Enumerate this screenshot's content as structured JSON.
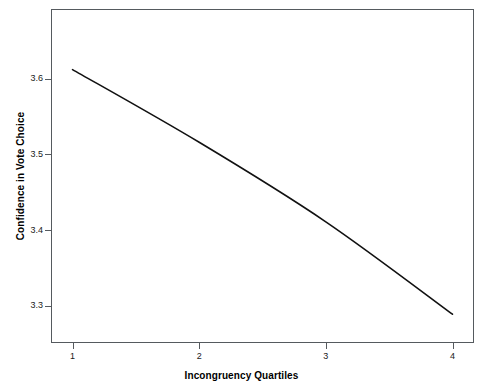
{
  "chart_data": {
    "type": "line",
    "title": "",
    "xlabel": "Incongruency Quartiles",
    "ylabel": "Confidence in Vote Choice",
    "x": [
      1,
      2,
      3,
      4
    ],
    "categories": [
      "1",
      "2",
      "3",
      "4"
    ],
    "values": [
      3.612,
      3.516,
      3.411,
      3.289
    ],
    "series": [
      {
        "name": "Confidence in Vote Choice",
        "values": [
          3.612,
          3.516,
          3.411,
          3.289
        ],
        "color": "#111111"
      }
    ],
    "xlim": [
      0.83,
      4.17
    ],
    "ylim": [
      3.251,
      3.692
    ],
    "xticks": [
      1,
      2,
      3,
      4
    ],
    "xtick_labels": [
      "1",
      "2",
      "3",
      "4"
    ],
    "yticks": [
      3.3,
      3.4,
      3.5,
      3.6
    ],
    "ytick_labels": [
      "3.3",
      "3.4",
      "3.5",
      "3.6"
    ],
    "grid": false,
    "legend": false,
    "legend_position": "none",
    "line_style": "solid",
    "markers": false,
    "frame_color": "#555a5e",
    "background_color": "#ffffff"
  }
}
